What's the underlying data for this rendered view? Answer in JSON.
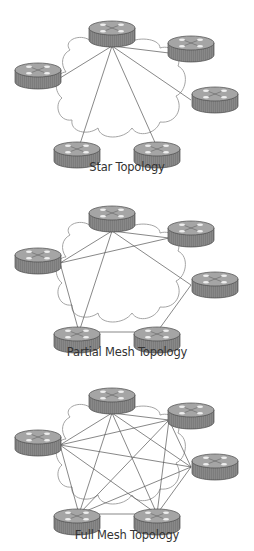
{
  "figure": {
    "diagrams": [
      {
        "id": "star",
        "label": "Star Topology",
        "label_y": 169,
        "y_offset": 0,
        "links": [
          [
            "A",
            "B"
          ],
          [
            "A",
            "C"
          ],
          [
            "A",
            "D"
          ],
          [
            "A",
            "E"
          ],
          [
            "A",
            "F"
          ]
        ],
        "hub": "A"
      },
      {
        "id": "partial",
        "label": "Partial Mesh Topology",
        "label_y": 354,
        "y_offset": 185,
        "links": [
          [
            "A",
            "B"
          ],
          [
            "A",
            "F"
          ],
          [
            "A",
            "C"
          ],
          [
            "A",
            "E"
          ],
          [
            "F",
            "B"
          ],
          [
            "F",
            "E"
          ],
          [
            "E",
            "D"
          ],
          [
            "D",
            "C"
          ]
        ]
      },
      {
        "id": "full",
        "label": "Full Mesh Topology",
        "label_y": 536,
        "y_offset": 367,
        "links": [
          [
            "A",
            "B"
          ],
          [
            "A",
            "C"
          ],
          [
            "A",
            "D"
          ],
          [
            "A",
            "E"
          ],
          [
            "A",
            "F"
          ],
          [
            "B",
            "C"
          ],
          [
            "B",
            "D"
          ],
          [
            "B",
            "E"
          ],
          [
            "B",
            "F"
          ],
          [
            "C",
            "D"
          ],
          [
            "C",
            "E"
          ],
          [
            "C",
            "F"
          ],
          [
            "D",
            "E"
          ],
          [
            "D",
            "F"
          ],
          [
            "E",
            "F"
          ]
        ]
      }
    ],
    "nodes": {
      "A": {
        "x": 112,
        "y": 28,
        "port_dx": 0,
        "port_dy": 18
      },
      "B": {
        "x": 191,
        "y": 43,
        "port_dx": -22,
        "port_dy": 10
      },
      "F": {
        "x": 38,
        "y": 70,
        "port_dx": 22,
        "port_dy": 8
      },
      "C": {
        "x": 215,
        "y": 94,
        "port_dx": -24,
        "port_dy": 6
      },
      "E": {
        "x": 77,
        "y": 149,
        "port_dx": 2,
        "port_dy": -2
      },
      "D": {
        "x": 157,
        "y": 149,
        "port_dx": 0,
        "port_dy": -2
      }
    },
    "colors": {
      "router_body": "#8c8c8c",
      "router_side": "#7a7a7a",
      "router_top": "#a3a3a3",
      "router_outline": "#4a4a4a",
      "router_arrows": "#e8e8e8",
      "cloud": "#9a9a9a",
      "link": "#555555",
      "label": "#333333"
    }
  }
}
